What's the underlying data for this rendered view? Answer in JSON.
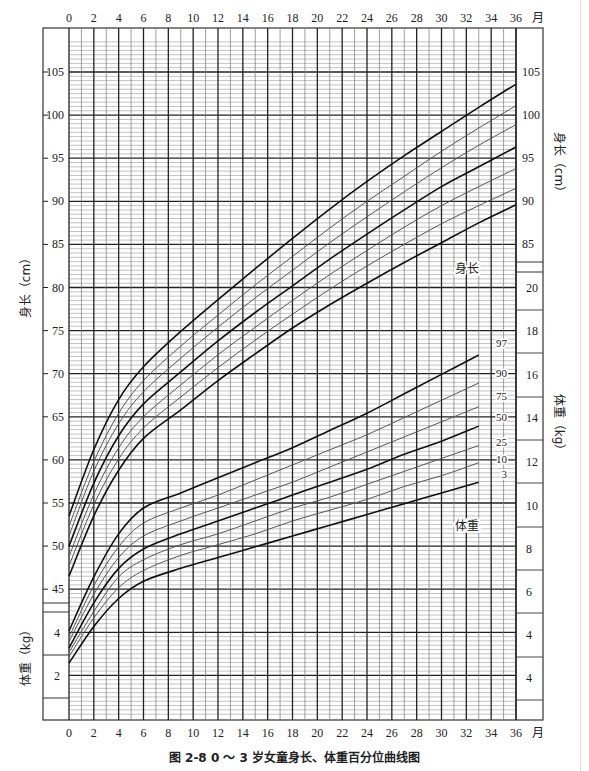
{
  "caption": "图 2-8   0 ～ 3 岁女童身长、体重百分位曲线图",
  "labels": {
    "month_unit": "月",
    "length_axis_left": "身长（cm）",
    "length_axis_right": "身长（cm）",
    "weight_axis_left": "体重（kg）",
    "weight_axis_right": "体重（kg）",
    "length_curve_label": "身长",
    "weight_curve_label": "体重"
  },
  "chart_data": {
    "type": "line",
    "figure_number": "图 2-8",
    "xlabel": "月",
    "x_ticks": [
      0,
      2,
      4,
      6,
      8,
      10,
      12,
      14,
      16,
      18,
      20,
      22,
      24,
      26,
      28,
      30,
      32,
      34,
      36
    ],
    "xlim": [
      0,
      36
    ],
    "grid": true,
    "length": {
      "ylabel": "身长（cm）",
      "left_ticks": [
        45,
        50,
        55,
        60,
        65,
        70,
        75,
        80,
        85,
        90,
        95,
        100,
        105
      ],
      "right_ticks": [
        85,
        90,
        95,
        100,
        105
      ],
      "x": [
        0,
        2,
        4,
        6,
        9,
        12,
        15,
        18,
        21,
        24,
        27,
        30,
        33,
        36
      ],
      "series": [
        {
          "name": "97",
          "values": [
            53.5,
            61.2,
            67.0,
            70.8,
            74.9,
            78.6,
            82.2,
            85.7,
            89.1,
            92.3,
            95.3,
            98.1,
            100.9,
            103.6
          ]
        },
        {
          "name": "90",
          "values": [
            52.3,
            59.8,
            65.4,
            69.2,
            73.2,
            76.8,
            80.3,
            83.6,
            86.9,
            90.0,
            92.9,
            95.8,
            98.5,
            101.1
          ]
        },
        {
          "name": "75",
          "values": [
            51.2,
            58.7,
            64.2,
            67.9,
            71.8,
            75.4,
            78.8,
            82.0,
            85.2,
            88.2,
            91.1,
            93.9,
            96.5,
            98.9
          ]
        },
        {
          "name": "50",
          "values": [
            50.0,
            57.3,
            62.8,
            66.5,
            70.2,
            73.8,
            77.1,
            80.2,
            83.3,
            86.2,
            89.0,
            91.7,
            94.0,
            96.3
          ]
        },
        {
          "name": "25",
          "values": [
            48.8,
            56.0,
            61.4,
            65.0,
            68.7,
            72.2,
            75.4,
            78.5,
            81.5,
            84.3,
            87.0,
            89.5,
            91.7,
            93.8
          ]
        },
        {
          "name": "10",
          "values": [
            47.7,
            54.8,
            60.1,
            63.7,
            67.3,
            70.7,
            73.9,
            76.9,
            79.8,
            82.5,
            85.0,
            87.4,
            89.5,
            91.5
          ]
        },
        {
          "name": "3",
          "values": [
            46.5,
            53.5,
            58.8,
            62.5,
            65.8,
            69.2,
            72.3,
            75.3,
            78.0,
            80.5,
            82.9,
            85.2,
            87.5,
            89.6
          ]
        }
      ]
    },
    "weight": {
      "ylabel": "体重（kg）",
      "left_ticks": [
        2,
        4
      ],
      "right_ticks": [
        4,
        4,
        6,
        8,
        10,
        12,
        14,
        16,
        18,
        20
      ],
      "x": [
        0,
        2,
        4,
        6,
        9,
        12,
        15,
        18,
        21,
        24,
        27,
        30,
        33,
        36
      ],
      "series": [
        {
          "name": "97",
          "values": [
            4.1,
            6.6,
            8.6,
            9.8,
            10.5,
            11.2,
            11.9,
            12.6,
            13.4,
            14.2,
            15.1,
            16.0,
            16.9,
            17.5
          ]
        },
        {
          "name": "90",
          "values": [
            3.8,
            6.2,
            8.0,
            9.1,
            9.8,
            10.4,
            11.1,
            11.8,
            12.5,
            13.2,
            14.0,
            14.8,
            15.6,
            16.2
          ]
        },
        {
          "name": "75",
          "values": [
            3.6,
            5.8,
            7.5,
            8.5,
            9.2,
            9.8,
            10.4,
            11.0,
            11.7,
            12.4,
            13.1,
            13.8,
            14.5,
            15.1
          ]
        },
        {
          "name": "50",
          "values": [
            3.3,
            5.4,
            7.0,
            7.9,
            8.6,
            9.2,
            9.8,
            10.4,
            11.0,
            11.6,
            12.3,
            12.9,
            13.6,
            14.2
          ]
        },
        {
          "name": "25",
          "values": [
            3.1,
            5.0,
            6.6,
            7.4,
            8.1,
            8.6,
            9.2,
            9.8,
            10.3,
            10.9,
            11.5,
            12.1,
            12.7,
            13.2
          ]
        },
        {
          "name": "10",
          "values": [
            2.9,
            4.7,
            6.1,
            6.9,
            7.6,
            8.1,
            8.6,
            9.2,
            9.7,
            10.2,
            10.8,
            11.3,
            11.9,
            12.4
          ]
        },
        {
          "name": "3",
          "values": [
            2.6,
            4.3,
            5.6,
            6.4,
            7.0,
            7.5,
            8.0,
            8.5,
            9.0,
            9.5,
            10.0,
            10.5,
            11.0,
            11.5
          ]
        }
      ]
    },
    "percentile_labels": [
      "97",
      "90",
      "75",
      "50",
      "25",
      "10",
      "3"
    ],
    "bold_series": [
      "97",
      "50",
      "3"
    ]
  }
}
